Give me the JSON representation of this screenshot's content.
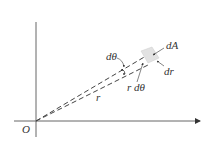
{
  "diagram": {
    "labels": {
      "origin": "O",
      "radius": "r",
      "dtheta": "dθ",
      "arc": "r dθ",
      "area": "dA",
      "dr": "dr"
    },
    "colors": {
      "axis": "#555555",
      "dashed": "#444444",
      "element_fill": "#e2e2e2"
    }
  }
}
